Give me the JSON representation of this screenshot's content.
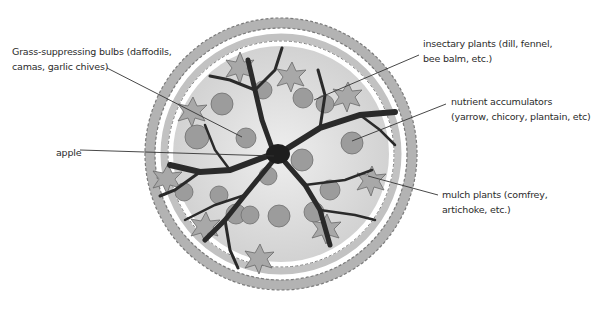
{
  "diagram": {
    "colors": {
      "background": "#ffffff",
      "text": "#2b2b2b",
      "leader_line": "#333333",
      "trunk_branches": "#2a2a2a",
      "outer_ring_fill": "#b8b8b8",
      "outer_ring_stroke": "#6e6e6e",
      "canopy_fill": "#dedede",
      "bulb_fill": "#9a9a9a",
      "leaf_fill": "#a9a9a9"
    },
    "labels": {
      "bulbs": {
        "line1": "Grass-suppressing bulbs (daffodils,",
        "line2": "camas, garlic chives)"
      },
      "insectary": {
        "line1": "insectary plants (dill, fennel,",
        "line2": "bee balm, etc.)"
      },
      "nutrient": {
        "line1": "nutrient accumulators",
        "line2": "(yarrow, chicory, plantain, etc)"
      },
      "apple": {
        "line1": "apple"
      },
      "mulch": {
        "line1": "mulch plants (comfrey,",
        "line2": "artichoke, etc.)"
      }
    }
  }
}
